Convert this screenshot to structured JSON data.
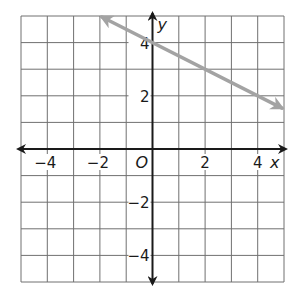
{
  "chart_data": {
    "type": "line",
    "title": "",
    "xlabel": "x",
    "ylabel": "y",
    "xlim": [
      -5,
      5
    ],
    "ylim": [
      -5,
      5
    ],
    "grid": true,
    "x_ticks": [
      -4,
      -2,
      2,
      4
    ],
    "y_ticks": [
      4,
      2,
      -2,
      -4
    ],
    "x_tick_labels": [
      "−4",
      "−2",
      "2",
      "4"
    ],
    "y_tick_labels": [
      "4",
      "2",
      "−2",
      "−4"
    ],
    "origin_label": "O",
    "series": [
      {
        "name": "line",
        "equation": "y = -1/2 x + 4",
        "slope": -0.5,
        "intercept": 4,
        "x": [
          -2,
          0,
          5
        ],
        "y": [
          5,
          4,
          1.5
        ],
        "arrows": "both",
        "color": "#a3a3a3"
      }
    ]
  },
  "labels": {
    "x_axis": "x",
    "y_axis": "y",
    "origin": "O",
    "x_ticks": [
      "−4",
      "−2",
      "2",
      "4"
    ],
    "y_ticks": [
      "4",
      "2",
      "−2",
      "−4"
    ]
  },
  "colors": {
    "grid": "#707070",
    "axis": "#1a1a1a",
    "line": "#a3a3a3",
    "background": "#ffffff"
  }
}
